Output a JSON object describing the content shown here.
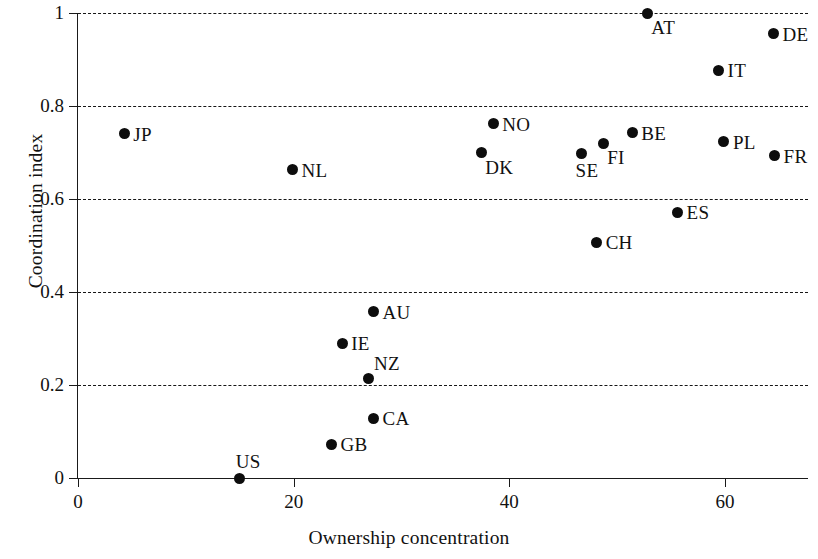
{
  "chart_data": {
    "type": "scatter",
    "title": "",
    "xlabel": "Ownership concentration",
    "ylabel": "Coordination index",
    "xlim": [
      0,
      67.7
    ],
    "ylim": [
      0,
      1
    ],
    "xticks": [
      0,
      20,
      40,
      60
    ],
    "xticklabels": [
      "0",
      "20",
      "40",
      "60"
    ],
    "yticks": [
      0,
      0.2,
      0.4,
      0.6,
      0.8,
      1
    ],
    "yticklabels": [
      "0",
      "0.2",
      "0.4",
      "0.6",
      "0.8",
      "1"
    ],
    "grid": "horizontal-dashed",
    "gridlines_y": [
      0.2,
      0.4,
      0.6,
      0.8,
      1
    ],
    "legend": "none",
    "marker_color": "#0d0d0d",
    "points": [
      {
        "label": "AT",
        "x": 52.8,
        "y": 1.0,
        "label_pos": "br"
      },
      {
        "label": "DE",
        "x": 64.5,
        "y": 0.955,
        "label_pos": "right"
      },
      {
        "label": "IT",
        "x": 59.4,
        "y": 0.877,
        "label_pos": "right"
      },
      {
        "label": "NO",
        "x": 38.5,
        "y": 0.762,
        "label_pos": "right"
      },
      {
        "label": "JP",
        "x": 4.3,
        "y": 0.74,
        "label_pos": "right"
      },
      {
        "label": "BE",
        "x": 51.4,
        "y": 0.742,
        "label_pos": "right"
      },
      {
        "label": "PL",
        "x": 59.9,
        "y": 0.723,
        "label_pos": "right"
      },
      {
        "label": "FI",
        "x": 48.7,
        "y": 0.72,
        "label_pos": "br"
      },
      {
        "label": "DK",
        "x": 37.4,
        "y": 0.7,
        "label_pos": "br"
      },
      {
        "label": "SE",
        "x": 46.7,
        "y": 0.697,
        "label_pos": "below"
      },
      {
        "label": "FR",
        "x": 64.6,
        "y": 0.693,
        "label_pos": "right"
      },
      {
        "label": "NL",
        "x": 19.9,
        "y": 0.663,
        "label_pos": "right"
      },
      {
        "label": "ES",
        "x": 55.6,
        "y": 0.572,
        "label_pos": "right"
      },
      {
        "label": "CH",
        "x": 48.1,
        "y": 0.507,
        "label_pos": "right"
      },
      {
        "label": "AU",
        "x": 27.4,
        "y": 0.357,
        "label_pos": "right"
      },
      {
        "label": "IE",
        "x": 24.5,
        "y": 0.29,
        "label_pos": "right"
      },
      {
        "label": "NZ",
        "x": 26.9,
        "y": 0.215,
        "label_pos": "tr"
      },
      {
        "label": "CA",
        "x": 27.4,
        "y": 0.129,
        "label_pos": "right"
      },
      {
        "label": "GB",
        "x": 23.5,
        "y": 0.073,
        "label_pos": "right"
      },
      {
        "label": "US",
        "x": 15.0,
        "y": 0.0,
        "label_pos": "above"
      }
    ]
  }
}
